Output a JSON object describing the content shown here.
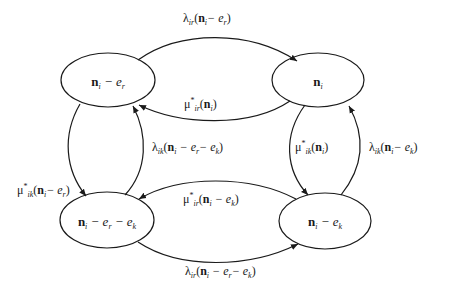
{
  "nodes": [
    {
      "id": "tl",
      "label_bold": "n",
      "label_sub": "i",
      "label_rest": " − e",
      "label_rest_sub": "r",
      "label_rest2": "",
      "label_rest2_sub": ""
    },
    {
      "id": "tr",
      "label_bold": "n",
      "label_sub": "i",
      "label_rest": "",
      "label_rest_sub": "",
      "label_rest2": "",
      "label_rest2_sub": ""
    },
    {
      "id": "bl",
      "label_bold": "n",
      "label_sub": "i",
      "label_rest": " − e",
      "label_rest_sub": "r",
      "label_rest2": " − e",
      "label_rest2_sub": "k"
    },
    {
      "id": "br",
      "label_bold": "n",
      "label_sub": "i",
      "label_rest": " − e",
      "label_rest_sub": "k",
      "label_rest2": "",
      "label_rest2_sub": ""
    }
  ],
  "edges": [
    {
      "id": "tl-to-tr",
      "symbol": "λ",
      "sup": "",
      "sub": "ir",
      "arg_bold": "n",
      "arg_sub": "i",
      "arg_rest": "− e",
      "arg_rest_sub": "r",
      "arg_rest2": "",
      "arg_rest2_sub": ""
    },
    {
      "id": "tr-to-tl",
      "symbol": "μ",
      "sup": "*",
      "sub": "ir",
      "arg_bold": "n",
      "arg_sub": "i",
      "arg_rest": "",
      "arg_rest_sub": "",
      "arg_rest2": "",
      "arg_rest2_sub": ""
    },
    {
      "id": "tl-to-bl",
      "symbol": "μ",
      "sup": "*",
      "sub": "ik",
      "arg_bold": "n",
      "arg_sub": "i",
      "arg_rest": "− e",
      "arg_rest_sub": "r",
      "arg_rest2": "",
      "arg_rest2_sub": ""
    },
    {
      "id": "bl-to-tl",
      "symbol": "λ",
      "sup": "",
      "sub": "ik",
      "arg_bold": "n",
      "arg_sub": "i",
      "arg_rest": " − e",
      "arg_rest_sub": "r",
      "arg_rest2": "− e",
      "arg_rest2_sub": "k"
    },
    {
      "id": "tr-to-br",
      "symbol": "μ",
      "sup": "*",
      "sub": "ik",
      "arg_bold": "n",
      "arg_sub": "i",
      "arg_rest": "",
      "arg_rest_sub": "",
      "arg_rest2": "",
      "arg_rest2_sub": ""
    },
    {
      "id": "br-to-tr",
      "symbol": "λ",
      "sup": "",
      "sub": "ik",
      "arg_bold": "n",
      "arg_sub": "i",
      "arg_rest": "− e",
      "arg_rest_sub": "k",
      "arg_rest2": "",
      "arg_rest2_sub": ""
    },
    {
      "id": "br-to-bl",
      "symbol": "μ",
      "sup": "*",
      "sub": "ir",
      "arg_bold": "n",
      "arg_sub": "i",
      "arg_rest": " − e",
      "arg_rest_sub": "k",
      "arg_rest2": "",
      "arg_rest2_sub": ""
    },
    {
      "id": "bl-to-br",
      "symbol": "λ",
      "sup": "",
      "sub": "ir",
      "arg_bold": "n",
      "arg_sub": "i",
      "arg_rest": " − e",
      "arg_rest_sub": "r",
      "arg_rest2": "− e",
      "arg_rest2_sub": "k"
    }
  ],
  "colors": {
    "stroke": "#1a1a1a",
    "background": "#ffffff"
  }
}
